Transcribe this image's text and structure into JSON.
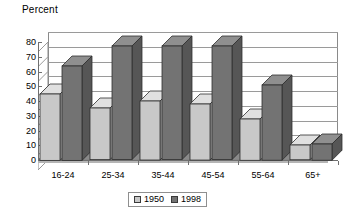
{
  "chart_data": {
    "type": "bar",
    "title": "Percent",
    "xlabel": "",
    "ylabel": "",
    "ylim": [
      0,
      80
    ],
    "yticks": [
      0,
      10,
      20,
      30,
      40,
      50,
      60,
      70,
      80
    ],
    "grid": true,
    "legend_position": "bottom-center",
    "style": "3d-clustered-column",
    "categories": [
      "16-24",
      "25-34",
      "35-44",
      "45-54",
      "55-64",
      "65+"
    ],
    "series": [
      {
        "name": "1950",
        "color": "#c8c8c8",
        "values": [
          45,
          35,
          40,
          38,
          28,
          10
        ]
      },
      {
        "name": "1998",
        "color": "#737373",
        "values": [
          64,
          77,
          77,
          77,
          51,
          11
        ]
      }
    ]
  },
  "axis": {
    "y_tick_labels": [
      "80",
      "70",
      "60",
      "50",
      "40",
      "30",
      "20",
      "10",
      "0"
    ]
  },
  "legend": {
    "entries": [
      {
        "label": "1950"
      },
      {
        "label": "1998"
      }
    ]
  },
  "colors": {
    "series_1950_front": "#c8c8c8",
    "series_1950_top": "#e0e0e0",
    "series_1950_side": "#a6a6a6",
    "series_1998_front": "#737373",
    "series_1998_top": "#8f8f8f",
    "series_1998_side": "#565656",
    "floor": "#8a8a8a",
    "floor_front": "#b5b5b5",
    "grid": "#9a9a9a",
    "axis": "#6f6f6f"
  }
}
